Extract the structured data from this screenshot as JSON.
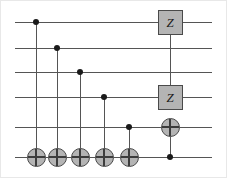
{
  "figure": {
    "width": 228,
    "height": 179,
    "background_color": "#ffffff",
    "frame_color": "#e8e8e8"
  },
  "style": {
    "wire_color": "#555555",
    "gate_fill": "#b4b4b4",
    "gate_border": "#4a4a4a",
    "control_dot_color": "#1a1a1a",
    "gate_label_color": "#1a1a1a"
  },
  "circuit": {
    "num_qubits": 6,
    "wire_x_start": 15,
    "wire_x_end": 212,
    "wire_y": [
      22,
      48,
      72,
      97,
      127,
      157
    ],
    "wires": [
      {
        "index": 0,
        "y": 22
      },
      {
        "index": 1,
        "y": 48
      },
      {
        "index": 2,
        "y": 72
      },
      {
        "index": 3,
        "y": 97
      },
      {
        "index": 4,
        "y": 127
      },
      {
        "index": 5,
        "y": 157
      }
    ],
    "gates": [
      {
        "id": "cnot-1",
        "type": "cnot",
        "x": 36,
        "control_wire": 0,
        "control_y": 22,
        "target_wire": 5,
        "target_y": 157,
        "label": ""
      },
      {
        "id": "cnot-2",
        "type": "cnot",
        "x": 57,
        "control_wire": 1,
        "control_y": 48,
        "target_wire": 5,
        "target_y": 157,
        "label": ""
      },
      {
        "id": "cnot-3",
        "type": "cnot",
        "x": 80,
        "control_wire": 2,
        "control_y": 72,
        "target_wire": 5,
        "target_y": 157,
        "label": ""
      },
      {
        "id": "cnot-4",
        "type": "cnot",
        "x": 104,
        "control_wire": 3,
        "control_y": 97,
        "target_wire": 5,
        "target_y": 157,
        "label": ""
      },
      {
        "id": "cnot-5",
        "type": "cnot",
        "x": 129,
        "control_wire": 4,
        "control_y": 127,
        "target_wire": 5,
        "target_y": 157,
        "label": ""
      },
      {
        "id": "cz-1",
        "type": "controlled-z",
        "x": 170,
        "top_wire": 0,
        "top_y": 22,
        "bottom_wire": 3,
        "bottom_y": 97,
        "label": "Z"
      },
      {
        "id": "cnot-6",
        "type": "cnot",
        "x": 170,
        "control_wire": 5,
        "control_y": 157,
        "target_wire": 4,
        "target_y": 127,
        "label": ""
      }
    ],
    "z_gate_label": "Z"
  }
}
